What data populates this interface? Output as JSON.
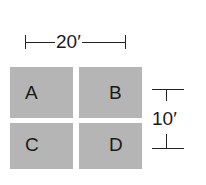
{
  "diagram": {
    "width_dimension": {
      "label": "20′",
      "orientation": "horizontal"
    },
    "height_dimension": {
      "label": "10′",
      "orientation": "vertical"
    },
    "rooms": [
      {
        "id": "A",
        "label": "A",
        "position": "top-left"
      },
      {
        "id": "B",
        "label": "B",
        "position": "top-right"
      },
      {
        "id": "C",
        "label": "C",
        "position": "bottom-left"
      },
      {
        "id": "D",
        "label": "D",
        "position": "bottom-right"
      }
    ],
    "colors": {
      "room_fill": "#b5b5b5",
      "line": "#222222",
      "text": "#1a1a1a"
    }
  }
}
